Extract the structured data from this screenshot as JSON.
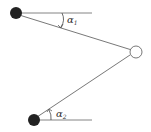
{
  "diagram": {
    "nodes": [
      {
        "id": "top-node",
        "style": "filled",
        "color": "#222222"
      },
      {
        "id": "right-node",
        "style": "hollow",
        "color": "#ffffff"
      },
      {
        "id": "bottom-node",
        "style": "filled",
        "color": "#222222"
      }
    ],
    "angles": [
      {
        "symbol": "α",
        "subscript": "1"
      },
      {
        "symbol": "α",
        "subscript": "2"
      }
    ],
    "line_color": "#555555"
  }
}
